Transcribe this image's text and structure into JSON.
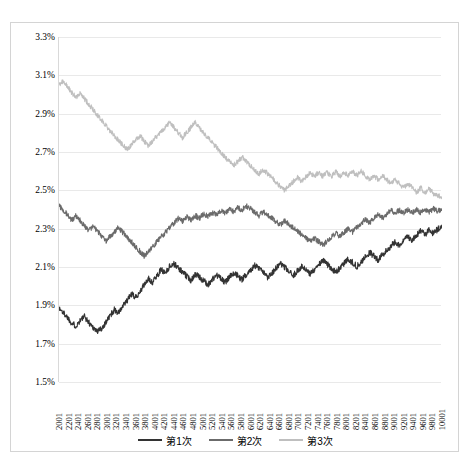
{
  "chart_data": {
    "type": "line",
    "title": "",
    "xlabel": "",
    "ylabel": "",
    "ylim": [
      1.5,
      3.3
    ],
    "ytick_step": 0.2,
    "ytick_labels": [
      "3.3%",
      "3.1%",
      "2.9%",
      "2.7%",
      "2.5%",
      "2.3%",
      "2.1%",
      "1.9%",
      "1.7%",
      "1.5%"
    ],
    "ytick_values": [
      3.3,
      3.1,
      2.9,
      2.7,
      2.5,
      2.3,
      2.1,
      1.9,
      1.7,
      1.5
    ],
    "grid": true,
    "legend_position": "bottom",
    "x_start": 2001,
    "x_end": 10001,
    "x_step": 200,
    "xtick_labels": [
      "2001",
      "2201",
      "2401",
      "2601",
      "2801",
      "3001",
      "3201",
      "3401",
      "3601",
      "3801",
      "4001",
      "4201",
      "4401",
      "4601",
      "4801",
      "5001",
      "5201",
      "5401",
      "5601",
      "5801",
      "6001",
      "6201",
      "6401",
      "6601",
      "6801",
      "7001",
      "7201",
      "7401",
      "7601",
      "7801",
      "8001",
      "8201",
      "8401",
      "8601",
      "8801",
      "9001",
      "9201",
      "9401",
      "9601",
      "9801",
      "10001"
    ],
    "series": [
      {
        "name": "第1次",
        "color": "#333333",
        "values": [
          1.885,
          1.862,
          1.838,
          1.807,
          1.792,
          1.823,
          1.841,
          1.811,
          1.786,
          1.764,
          1.779,
          1.812,
          1.846,
          1.877,
          1.861,
          1.893,
          1.925,
          1.958,
          1.941,
          1.972,
          2.006,
          2.038,
          2.021,
          2.054,
          2.086,
          2.071,
          2.103,
          2.118,
          2.096,
          2.074,
          2.052,
          2.031,
          2.063,
          2.046,
          2.028,
          2.007,
          2.034,
          2.058,
          2.041,
          2.019,
          2.046,
          2.072,
          2.055,
          2.033,
          2.061,
          2.086,
          2.108,
          2.092,
          2.071,
          2.048,
          2.069,
          2.093,
          2.116,
          2.098,
          2.076,
          2.054,
          2.079,
          2.102,
          2.084,
          2.062,
          2.088,
          2.111,
          2.133,
          2.115,
          2.094,
          2.071,
          2.096,
          2.119,
          2.142,
          2.124,
          2.103,
          2.127,
          2.151,
          2.176,
          2.158,
          2.137,
          2.162,
          2.186,
          2.209,
          2.231,
          2.213,
          2.236,
          2.258,
          2.241,
          2.264,
          2.287,
          2.269,
          2.292,
          2.275,
          2.298,
          2.305
        ]
      },
      {
        "name": "第2次",
        "color": "#6b6b6b",
        "values": [
          2.421,
          2.398,
          2.372,
          2.346,
          2.368,
          2.341,
          2.315,
          2.289,
          2.312,
          2.286,
          2.261,
          2.236,
          2.259,
          2.283,
          2.306,
          2.281,
          2.256,
          2.231,
          2.206,
          2.182,
          2.157,
          2.181,
          2.206,
          2.231,
          2.256,
          2.281,
          2.305,
          2.329,
          2.352,
          2.338,
          2.361,
          2.347,
          2.369,
          2.355,
          2.378,
          2.364,
          2.386,
          2.372,
          2.394,
          2.381,
          2.403,
          2.389,
          2.411,
          2.397,
          2.419,
          2.405,
          2.386,
          2.368,
          2.391,
          2.373,
          2.355,
          2.337,
          2.319,
          2.341,
          2.323,
          2.305,
          2.287,
          2.269,
          2.251,
          2.233,
          2.251,
          2.233,
          2.215,
          2.234,
          2.256,
          2.277,
          2.259,
          2.281,
          2.302,
          2.284,
          2.306,
          2.327,
          2.349,
          2.331,
          2.352,
          2.373,
          2.355,
          2.376,
          2.397,
          2.379,
          2.398,
          2.381,
          2.401,
          2.383,
          2.402,
          2.384,
          2.403,
          2.385,
          2.404,
          2.392,
          2.398
        ]
      },
      {
        "name": "第3次",
        "color": "#bfbfbf",
        "values": [
          3.048,
          3.072,
          3.041,
          3.011,
          2.982,
          3.008,
          2.978,
          2.949,
          2.921,
          2.893,
          2.866,
          2.839,
          2.812,
          2.786,
          2.761,
          2.736,
          2.712,
          2.736,
          2.761,
          2.785,
          2.758,
          2.732,
          2.757,
          2.782,
          2.806,
          2.831,
          2.855,
          2.828,
          2.801,
          2.775,
          2.802,
          2.828,
          2.854,
          2.827,
          2.801,
          2.775,
          2.749,
          2.724,
          2.699,
          2.674,
          2.651,
          2.628,
          2.651,
          2.674,
          2.652,
          2.629,
          2.607,
          2.585,
          2.609,
          2.587,
          2.565,
          2.543,
          2.521,
          2.499,
          2.522,
          2.545,
          2.568,
          2.546,
          2.569,
          2.592,
          2.571,
          2.594,
          2.572,
          2.595,
          2.573,
          2.596,
          2.574,
          2.597,
          2.575,
          2.598,
          2.576,
          2.599,
          2.577,
          2.554,
          2.577,
          2.555,
          2.578,
          2.556,
          2.534,
          2.556,
          2.534,
          2.512,
          2.534,
          2.512,
          2.49,
          2.512,
          2.49,
          2.506,
          2.484,
          2.472,
          2.468
        ]
      }
    ]
  },
  "legend": {
    "items": [
      {
        "label": "第1次",
        "color": "#333333"
      },
      {
        "label": "第2次",
        "color": "#6b6b6b"
      },
      {
        "label": "第3次",
        "color": "#bfbfbf"
      }
    ]
  }
}
